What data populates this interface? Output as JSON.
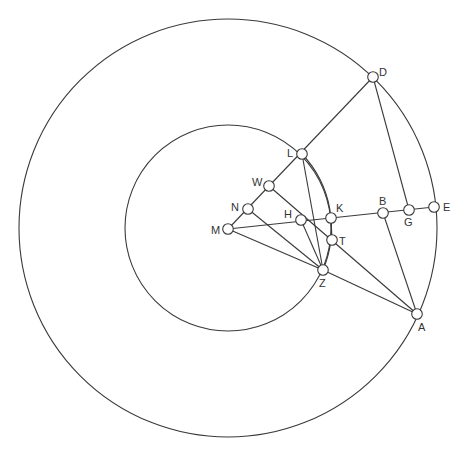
{
  "diagram": {
    "type": "geometric-construction",
    "stroke_color": "#3a3a3a",
    "background": "#ffffff",
    "circles": [
      {
        "name": "outer-circle",
        "cx": 228,
        "cy": 228,
        "r": 209
      },
      {
        "name": "inner-circle",
        "cx": 228,
        "cy": 228,
        "r": 103
      }
    ],
    "arcs": [
      {
        "name": "arc-L-K-Z",
        "from": "L",
        "through": "K",
        "to": "Z"
      }
    ],
    "points": [
      {
        "label": "D",
        "x": 373,
        "y": 77,
        "lx": 379,
        "ly": 76
      },
      {
        "label": "L",
        "x": 302,
        "y": 154,
        "lx": 287,
        "ly": 157
      },
      {
        "label": "W",
        "x": 269,
        "y": 186,
        "lx": 252,
        "ly": 186
      },
      {
        "label": "N",
        "x": 248,
        "y": 209,
        "lx": 231,
        "ly": 211
      },
      {
        "label": "M",
        "x": 228,
        "y": 229,
        "lx": 211,
        "ly": 234
      },
      {
        "label": "H",
        "x": 301,
        "y": 220,
        "lx": 284,
        "ly": 218
      },
      {
        "label": "K",
        "x": 331,
        "y": 218,
        "lx": 336,
        "ly": 212
      },
      {
        "label": "T",
        "x": 332,
        "y": 240,
        "lx": 339,
        "ly": 245
      },
      {
        "label": "Z",
        "x": 323,
        "y": 270,
        "lx": 319,
        "ly": 287
      },
      {
        "label": "B",
        "x": 383,
        "y": 213,
        "lx": 379,
        "ly": 205
      },
      {
        "label": "G",
        "x": 409,
        "y": 210,
        "lx": 404,
        "ly": 226
      },
      {
        "label": "E",
        "x": 434,
        "y": 207,
        "lx": 443,
        "ly": 211
      },
      {
        "label": "A",
        "x": 417,
        "y": 314,
        "lx": 418,
        "ly": 331
      }
    ],
    "segments": [
      {
        "name": "line-M-D",
        "from": "M",
        "to": "D"
      },
      {
        "name": "line-M-E",
        "from": "M",
        "to": "E"
      },
      {
        "name": "line-M-Z",
        "from": "M",
        "to": "Z"
      },
      {
        "name": "line-N-Z",
        "from": "N",
        "to": "Z"
      },
      {
        "name": "line-H-Z",
        "from": "H",
        "to": "Z"
      },
      {
        "name": "line-L-Z",
        "from": "L",
        "to": "Z"
      },
      {
        "name": "line-K-T",
        "from": "K",
        "to": "T"
      },
      {
        "name": "line-W-A",
        "from": "W",
        "to": "A"
      },
      {
        "name": "line-Z-A",
        "from": "Z",
        "to": "A"
      },
      {
        "name": "line-B-A",
        "from": "B",
        "to": "A"
      },
      {
        "name": "line-D-G",
        "from": "D",
        "to": "G"
      }
    ]
  }
}
